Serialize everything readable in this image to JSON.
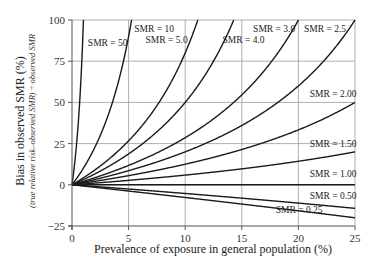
{
  "chart_data": {
    "type": "line",
    "title": "",
    "xlabel": "Prevalence of exposure in general population (%)",
    "ylabel": "Bias in observed SMR (%)",
    "ylabel_sub": "(true relative risk–observed SMR) ÷ observed SMR",
    "xlim": [
      0,
      25
    ],
    "ylim": [
      -25,
      100
    ],
    "x_ticks": [
      0,
      5,
      10,
      15,
      20,
      25
    ],
    "y_ticks": [
      -25,
      0,
      25,
      50,
      75,
      100
    ],
    "x_tick_labels": [
      "0",
      "5",
      "10",
      "15",
      "20",
      "25"
    ],
    "y_tick_labels": [
      "−25",
      "0",
      "25",
      "50",
      "75",
      "100"
    ],
    "grid": true,
    "legend": "inline labels",
    "formula": "bias(%) = 100 * p(SMR-1) / (1 - p*SMR), p = prevalence/100",
    "series": [
      {
        "name": "SMR = 50",
        "smr": 50,
        "label": "SMR = 50",
        "values_at_x": {
          "0": 0,
          "1.01": 100
        }
      },
      {
        "name": "SMR = 10",
        "smr": 10,
        "label": "SMR = 10",
        "values_at_x": {
          "0": 0,
          "2.5": 30,
          "5.26": 100
        }
      },
      {
        "name": "SMR = 5.0",
        "smr": 5.0,
        "label": "SMR = 5.0",
        "values_at_x": {
          "0": 0,
          "5": 26.7,
          "11.1": 100
        }
      },
      {
        "name": "SMR = 4.0",
        "smr": 4.0,
        "label": "SMR = 4.0",
        "values_at_x": {
          "0": 0,
          "5": 18.8,
          "10": 50,
          "14.3": 100
        }
      },
      {
        "name": "SMR = 3.0",
        "smr": 3.0,
        "label": "SMR = 3.0",
        "values_at_x": {
          "0": 0,
          "5": 11.8,
          "10": 28.6,
          "15": 54.5,
          "20": 100
        }
      },
      {
        "name": "SMR = 2.5",
        "smr": 2.5,
        "label": "SMR = 2.5",
        "values_at_x": {
          "0": 0,
          "5": 8.6,
          "10": 20,
          "15": 36,
          "20": 60,
          "25": 100
        }
      },
      {
        "name": "SMR = 2.00",
        "smr": 2.0,
        "label": "SMR = 2.00",
        "values_at_x": {
          "0": 0,
          "5": 5.6,
          "10": 12.5,
          "15": 21.4,
          "20": 33.3,
          "25": 50
        }
      },
      {
        "name": "SMR = 1.50",
        "smr": 1.5,
        "label": "SMR = 1.50",
        "values_at_x": {
          "0": 0,
          "5": 2.7,
          "10": 5.9,
          "15": 9.7,
          "20": 14.3,
          "25": 20
        }
      },
      {
        "name": "SMR = 1.00",
        "smr": 1.0,
        "label": "SMR = 1.00",
        "values_at_x": {
          "0": 0,
          "25": 0
        }
      },
      {
        "name": "SMR = 0.50",
        "smr": 0.5,
        "label": "SMR = 0.50",
        "values_at_x": {
          "0": 0,
          "5": -2.6,
          "10": -5.3,
          "15": -8.1,
          "20": -11.1,
          "25": -14.3
        }
      },
      {
        "name": "SMR = 0.25",
        "smr": 0.25,
        "label": "SMR = 0.25",
        "values_at_x": {
          "0": 0,
          "5": -3.8,
          "10": -7.7,
          "15": -11.7,
          "20": -15.8,
          "25": -20
        }
      }
    ],
    "label_positions": [
      {
        "label": "SMR = 50",
        "x_pct": 1.4,
        "y": 84
      },
      {
        "label": "SMR = 10",
        "x_pct": 5.5,
        "y": 93
      },
      {
        "label": "SMR = 5.0",
        "x_pct": 6.5,
        "y": 86
      },
      {
        "label": "SMR = 4.0",
        "x_pct": 13.3,
        "y": 86
      },
      {
        "label": "SMR = 3.0",
        "x_pct": 16.0,
        "y": 93
      },
      {
        "label": "SMR = 2.5",
        "x_pct": 20.5,
        "y": 93
      },
      {
        "label": "SMR = 2.00",
        "x_pct": 21.0,
        "y": 53
      },
      {
        "label": "SMR = 1.50",
        "x_pct": 21.0,
        "y": 23
      },
      {
        "label": "SMR = 1.00",
        "x_pct": 21.0,
        "y": 5
      },
      {
        "label": "SMR = 0.50",
        "x_pct": 21.0,
        "y": -8.5
      },
      {
        "label": "SMR = 0.25",
        "x_pct": 18.0,
        "y": -17
      }
    ]
  },
  "colors": {
    "curve": "#1a1a1a",
    "grid": "#9a9a9a",
    "axis": "#555555",
    "text": "#222222"
  }
}
